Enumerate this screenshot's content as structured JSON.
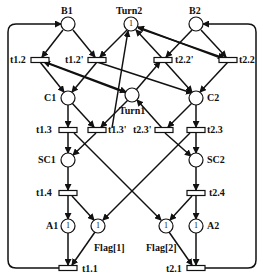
{
  "diagram": {
    "type": "petri-net",
    "places": [
      {
        "id": "B1",
        "label": "B1",
        "tokens": 0
      },
      {
        "id": "Turn2",
        "label": "Turn2",
        "tokens": 1
      },
      {
        "id": "B2",
        "label": "B2",
        "tokens": 0
      },
      {
        "id": "C1",
        "label": "C1",
        "tokens": 0
      },
      {
        "id": "Turn1",
        "label": "Turn1",
        "tokens": 0
      },
      {
        "id": "C2",
        "label": "C2",
        "tokens": 0
      },
      {
        "id": "SC1",
        "label": "SC1",
        "tokens": 0
      },
      {
        "id": "SC2",
        "label": "SC2",
        "tokens": 0
      },
      {
        "id": "A1",
        "label": "A1",
        "tokens": 1
      },
      {
        "id": "Flag1",
        "label": "Flag[1]",
        "tokens": 1
      },
      {
        "id": "Flag2",
        "label": "Flag[2]",
        "tokens": 1
      },
      {
        "id": "A2",
        "label": "A2",
        "tokens": 1
      }
    ],
    "transitions": [
      {
        "id": "t1.2",
        "label": "t1.2"
      },
      {
        "id": "t1.2p",
        "label": "t1.2'"
      },
      {
        "id": "t2.2p",
        "label": "t2.2'"
      },
      {
        "id": "t2.2",
        "label": "t2.2"
      },
      {
        "id": "t1.3",
        "label": "t1.3"
      },
      {
        "id": "t1.3p",
        "label": "t1.3'"
      },
      {
        "id": "t2.3p",
        "label": "t2.3'"
      },
      {
        "id": "t2.3",
        "label": "t2.3"
      },
      {
        "id": "t1.4",
        "label": "t1.4"
      },
      {
        "id": "t2.4",
        "label": "t2.4"
      },
      {
        "id": "t1.1",
        "label": "t1.1"
      },
      {
        "id": "t2.1",
        "label": "t2.1"
      }
    ],
    "token_symbol": "1"
  }
}
